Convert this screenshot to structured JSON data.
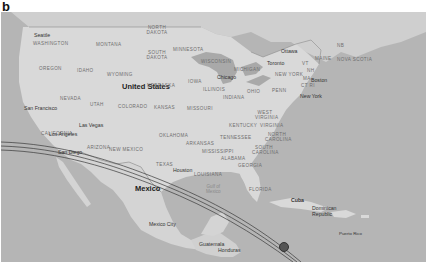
{
  "panel_label": "b",
  "map": {
    "countries": [
      {
        "name": "United States",
        "x": 121,
        "y": 82
      },
      {
        "name": "Mexico",
        "x": 134,
        "y": 184
      },
      {
        "name": "Cuba",
        "x": 337,
        "y": 200
      },
      {
        "name": "Dominican Republic",
        "x": 308,
        "y": 209
      },
      {
        "name": "Guatemala",
        "x": 198,
        "y": 241
      },
      {
        "name": "Honduras",
        "x": 217,
        "y": 247
      }
    ],
    "states": [
      {
        "name": "WASHINGTON",
        "x": 33,
        "y": 30
      },
      {
        "name": "MONTANA",
        "x": 95,
        "y": 31
      },
      {
        "name": "NORTH DAKOTA",
        "x": 147,
        "y": 25
      },
      {
        "name": "MINNESOTA",
        "x": 172,
        "y": 36
      },
      {
        "name": "OREGON",
        "x": 38,
        "y": 55
      },
      {
        "name": "IDAHO",
        "x": 76,
        "y": 57
      },
      {
        "name": "WYOMING",
        "x": 106,
        "y": 61
      },
      {
        "name": "SOUTH DAKOTA",
        "x": 147,
        "y": 50
      },
      {
        "name": "WISCONSIN",
        "x": 200,
        "y": 48
      },
      {
        "name": "MICHIGAN",
        "x": 233,
        "y": 56
      },
      {
        "name": "NEW YORK",
        "x": 274,
        "y": 61
      },
      {
        "name": "NEBRASKA",
        "x": 147,
        "y": 72
      },
      {
        "name": "IOWA",
        "x": 187,
        "y": 68
      },
      {
        "name": "ILLINOIS",
        "x": 203,
        "y": 87
      },
      {
        "name": "INDIANA",
        "x": 222,
        "y": 94
      },
      {
        "name": "OHIO",
        "x": 246,
        "y": 88
      },
      {
        "name": "PENN",
        "x": 271,
        "y": 88
      },
      {
        "name": "NEVADA",
        "x": 59,
        "y": 85
      },
      {
        "name": "UTAH",
        "x": 89,
        "y": 91
      },
      {
        "name": "COLORADO",
        "x": 118,
        "y": 91
      },
      {
        "name": "KANSAS",
        "x": 152,
        "y": 94
      },
      {
        "name": "MISSOURI",
        "x": 186,
        "y": 95
      },
      {
        "name": "WEST VIRGINIA",
        "x": 254,
        "y": 101
      },
      {
        "name": "VIRGINIA",
        "x": 259,
        "y": 111
      },
      {
        "name": "KENTUCKY",
        "x": 228,
        "y": 113
      },
      {
        "name": "CALIFORNIA",
        "x": 41,
        "y": 121
      },
      {
        "name": "ARIZONA",
        "x": 86,
        "y": 133
      },
      {
        "name": "NEW MEXICO",
        "x": 110,
        "y": 135
      },
      {
        "name": "OKLAHOMA",
        "x": 158,
        "y": 122
      },
      {
        "name": "TENNESSEE",
        "x": 218,
        "y": 124
      },
      {
        "name": "NORTH CAROLINA",
        "x": 262,
        "y": 122
      },
      {
        "name": "ARKANSAS",
        "x": 185,
        "y": 130
      },
      {
        "name": "MISSISSIPPI",
        "x": 201,
        "y": 138
      },
      {
        "name": "ALABAMA",
        "x": 220,
        "y": 145
      },
      {
        "name": "GEORGIA",
        "x": 237,
        "y": 152
      },
      {
        "name": "SOUTH CAROLINA",
        "x": 256,
        "y": 137
      },
      {
        "name": "TEXAS",
        "x": 155,
        "y": 152
      },
      {
        "name": "LOUISIANA",
        "x": 195,
        "y": 161
      },
      {
        "name": "FLORIDA",
        "x": 248,
        "y": 176
      },
      {
        "name": "MAINE",
        "x": 315,
        "y": 55
      },
      {
        "name": "NOVA SCOTIA",
        "x": 336,
        "y": 56
      },
      {
        "name": "NB",
        "x": 336,
        "y": 43
      },
      {
        "name": "VT",
        "x": 301,
        "y": 60
      },
      {
        "name": "NH",
        "x": 306,
        "y": 67
      },
      {
        "name": "MA",
        "x": 302,
        "y": 76
      },
      {
        "name": "CT RI",
        "x": 300,
        "y": 82
      }
    ],
    "cities": [
      {
        "name": "Seattle",
        "x": 34,
        "y": 22
      },
      {
        "name": "San Francisco",
        "x": 24,
        "y": 105
      },
      {
        "name": "Las Vegas",
        "x": 77,
        "y": 121
      },
      {
        "name": "Los Angeles",
        "x": 48,
        "y": 130
      },
      {
        "name": "San Diego",
        "x": 58,
        "y": 148
      },
      {
        "name": "Chicago",
        "x": 216,
        "y": 73
      },
      {
        "name": "Toronto",
        "x": 266,
        "y": 49
      },
      {
        "name": "Ottawa",
        "x": 281,
        "y": 38
      },
      {
        "name": "Boston",
        "x": 310,
        "y": 76
      },
      {
        "name": "New York",
        "x": 299,
        "y": 92
      },
      {
        "name": "Houston",
        "x": 173,
        "y": 165
      },
      {
        "name": "Mexico City",
        "x": 148,
        "y": 209
      },
      {
        "name": "Puerto Rico",
        "x": 338,
        "y": 216
      }
    ],
    "water_labels": [
      {
        "name": "Gulf of\nMexico",
        "x": 209,
        "y": 177
      }
    ],
    "colors": {
      "ocean": "#b5b5b5",
      "land": "#d9d9d9",
      "track": "#3a3a3a",
      "border": "#8c8c8c"
    }
  }
}
